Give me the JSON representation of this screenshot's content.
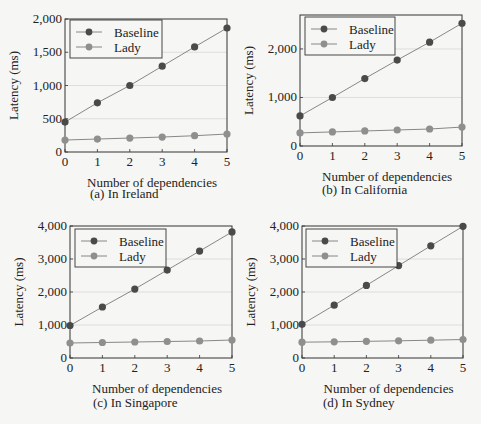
{
  "colors": {
    "baseline": "#4a4a4a",
    "lady": "#8f8f8f",
    "axis": "#333333",
    "grid": "#d8d8d8",
    "line": "#7a7a7a"
  },
  "chart_data": [
    {
      "id": "a",
      "type": "line",
      "caption": "(a) In Ireland",
      "xlabel": "Number of dependencies",
      "ylabel": "Latency (ms)",
      "x": [
        0,
        1,
        2,
        3,
        4,
        5
      ],
      "ylim": [
        0,
        2000
      ],
      "yticks": [
        0,
        500,
        1000,
        1500,
        2000
      ],
      "ytick_labels": [
        "0",
        "500",
        "1,000",
        "1,500",
        "2,000"
      ],
      "grid": true,
      "legend_position": "upper left",
      "series": [
        {
          "name": "Baseline",
          "values": [
            450,
            740,
            1000,
            1290,
            1580,
            1865
          ]
        },
        {
          "name": "Lady",
          "values": [
            180,
            195,
            210,
            225,
            245,
            270
          ]
        }
      ]
    },
    {
      "id": "b",
      "type": "line",
      "caption": "(b) In California",
      "xlabel": "Number of dependencies",
      "ylabel": "Latency (ms)",
      "x": [
        0,
        1,
        2,
        3,
        4,
        5
      ],
      "ylim": [
        0,
        2700
      ],
      "yticks": [
        0,
        1000,
        2000
      ],
      "ytick_labels": [
        "0",
        "1,000",
        "2,000"
      ],
      "grid": true,
      "legend_position": "upper left",
      "series": [
        {
          "name": "Baseline",
          "values": [
            620,
            1000,
            1390,
            1770,
            2140,
            2530
          ]
        },
        {
          "name": "Lady",
          "values": [
            270,
            290,
            310,
            330,
            350,
            390
          ]
        }
      ]
    },
    {
      "id": "c",
      "type": "line",
      "caption": "(c) In Singapore",
      "xlabel": "Number of dependencies",
      "ylabel": "Latency (ms)",
      "x": [
        0,
        1,
        2,
        3,
        4,
        5
      ],
      "ylim": [
        0,
        4000
      ],
      "yticks": [
        0,
        1000,
        2000,
        3000,
        4000
      ],
      "ytick_labels": [
        "0",
        "1,000",
        "2,000",
        "3,000",
        "4,000"
      ],
      "grid": true,
      "legend_position": "upper left",
      "series": [
        {
          "name": "Baseline",
          "values": [
            985,
            1545,
            2090,
            2665,
            3240,
            3820
          ]
        },
        {
          "name": "Lady",
          "values": [
            455,
            470,
            485,
            500,
            515,
            545
          ]
        }
      ]
    },
    {
      "id": "d",
      "type": "line",
      "caption": "(d) In Sydney",
      "xlabel": "Number of dependencies",
      "ylabel": "Latency (ms)",
      "x": [
        0,
        1,
        2,
        3,
        4,
        5
      ],
      "ylim": [
        0,
        4000
      ],
      "yticks": [
        0,
        1000,
        2000,
        3000,
        4000
      ],
      "ytick_labels": [
        "0",
        "1,000",
        "2,000",
        "3,000",
        "4,000"
      ],
      "grid": true,
      "legend_position": "upper left",
      "series": [
        {
          "name": "Baseline",
          "values": [
            1020,
            1600,
            2200,
            2800,
            3400,
            3990
          ]
        },
        {
          "name": "Lady",
          "values": [
            480,
            490,
            505,
            520,
            540,
            560
          ]
        }
      ]
    }
  ]
}
